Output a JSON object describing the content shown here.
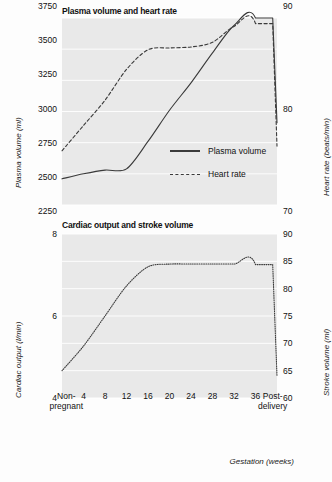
{
  "figure": {
    "xaxis_title": "Gestation (weeks)",
    "categories": [
      "Non-pregnant",
      "4",
      "8",
      "12",
      "16",
      "20",
      "24",
      "28",
      "32",
      "36",
      "Post-delivery"
    ],
    "colors": {
      "plot_background": "#e9e9e9",
      "gridline": "#ffffff",
      "line": "#3a3a3a",
      "text": "#111111"
    }
  },
  "panels": [
    {
      "title": "Plasma volume and heart rate",
      "left_axis_label": "Plasma volume (ml)",
      "right_axis_label": "Heart rate (beats/min)",
      "left_ticks": [
        "3750",
        "3500",
        "3250",
        "3000",
        "2750",
        "2500",
        "2250"
      ],
      "right_ticks": [
        "90",
        "80",
        "70"
      ],
      "legend": [
        {
          "label": "Plasma volume",
          "style": "solid"
        },
        {
          "label": "Heart rate",
          "style": "dashed"
        }
      ]
    },
    {
      "title": "Cardiac output and stroke volume",
      "left_axis_label": "Cardiac output (l/min)",
      "right_axis_label": "Stroke volume (ml)",
      "left_ticks": [
        "8",
        "6",
        "4"
      ],
      "right_ticks": [
        "90",
        "85",
        "80",
        "75",
        "70",
        "65",
        "60"
      ]
    }
  ],
  "chart_data": [
    {
      "type": "line",
      "title": "Plasma volume and heart rate",
      "xlabel": "Gestation (weeks)",
      "ylabel": "Plasma volume (ml)",
      "y2label": "Heart rate (beats/min)",
      "categories": [
        "Non-pregnant",
        "4",
        "8",
        "12",
        "16",
        "20",
        "24",
        "28",
        "32",
        "36",
        "Post-delivery"
      ],
      "x": [
        0,
        4,
        8,
        12,
        16,
        20,
        24,
        28,
        32,
        36,
        40
      ],
      "ylim": [
        2250,
        3750
      ],
      "y2lim": [
        70,
        90
      ],
      "yticks": [
        2250,
        2500,
        2750,
        3000,
        3250,
        3500,
        3750
      ],
      "y2ticks": [
        70,
        80,
        90
      ],
      "grid": true,
      "legend_position": "lower-right",
      "series": [
        {
          "name": "Plasma volume",
          "axis": "left",
          "style": "solid",
          "unit": "ml",
          "values": [
            2460,
            2500,
            2530,
            2540,
            2760,
            3010,
            3230,
            3470,
            3690,
            3750,
            2910
          ]
        },
        {
          "name": "Heart rate",
          "axis": "right",
          "style": "dashed",
          "unit": "beats/min",
          "values": [
            75.8,
            78.5,
            81.2,
            84.5,
            86.6,
            86.8,
            86.9,
            87.4,
            89.1,
            89.4,
            76.3
          ]
        }
      ]
    },
    {
      "type": "line",
      "title": "Cardiac output and stroke volume",
      "xlabel": "Gestation (weeks)",
      "ylabel": "Cardiac output (l/min)",
      "y2label": "Stroke volume (ml)",
      "categories": [
        "Non-pregnant",
        "4",
        "8",
        "12",
        "16",
        "20",
        "24",
        "28",
        "32",
        "36",
        "Post-delivery"
      ],
      "x": [
        0,
        4,
        8,
        12,
        16,
        20,
        24,
        28,
        32,
        36,
        40
      ],
      "ylim": [
        4,
        8
      ],
      "y2lim": [
        60,
        90
      ],
      "yticks": [
        4,
        6,
        8
      ],
      "y2ticks": [
        60,
        65,
        70,
        75,
        80,
        85,
        90
      ],
      "grid": true,
      "series": [
        {
          "name": "Cardiac output / stroke volume",
          "axis": "right",
          "style": "dotted",
          "unit": "ml",
          "values": [
            65.0,
            69.5,
            75.0,
            80.5,
            84.0,
            84.5,
            84.5,
            84.5,
            84.5,
            84.4,
            64.0
          ]
        }
      ]
    }
  ]
}
